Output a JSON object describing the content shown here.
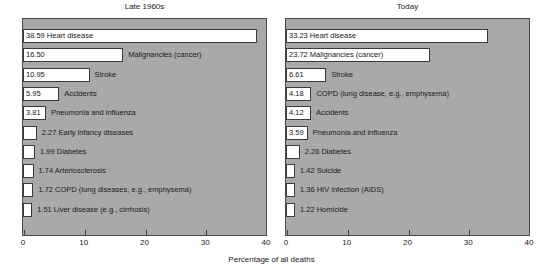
{
  "chart_data": {
    "type": "bar",
    "orientation": "horizontal",
    "title": "",
    "xlabel": "Percentage of all deaths",
    "ylabel": "Major causes of death",
    "xlim": [
      0,
      40
    ],
    "xticks": [
      0,
      10,
      20,
      30,
      40
    ],
    "grid": false,
    "legend": null,
    "panels": [
      {
        "title": "Late 1960s",
        "categories": [
          "Heart disease",
          "Malignancies (cancer)",
          "Stroke",
          "Accidents",
          "Pneumonia and influenza",
          "Early infancy diseases",
          "Diabetes",
          "Arteriosclerosis",
          "COPD (lung diseases, e.g., emphysema)",
          "Liver disease (e.g., cirrhosis)"
        ],
        "values": [
          38.59,
          16.5,
          10.95,
          5.95,
          3.81,
          2.27,
          1.99,
          1.74,
          1.72,
          1.51
        ],
        "bars": [
          {
            "value": "38.59",
            "label": "Heart disease",
            "label_inside": true
          },
          {
            "value": "16.50",
            "label": "Malignancies (cancer)",
            "label_inside": false
          },
          {
            "value": "10.95",
            "label": "Stroke",
            "label_inside": false
          },
          {
            "value": "5.95",
            "label": "Accidents",
            "label_inside": false
          },
          {
            "value": "3.81",
            "label": "Pneumonia and influenza",
            "label_inside": false
          },
          {
            "value": "2.27",
            "label": "Early infancy diseases",
            "label_inside": false
          },
          {
            "value": "1.99",
            "label": "Diabetes",
            "label_inside": false
          },
          {
            "value": "1.74",
            "label": "Arteriosclerosis",
            "label_inside": false
          },
          {
            "value": "1.72",
            "label": "COPD (lung diseases, e.g., emphysema)",
            "label_inside": false
          },
          {
            "value": "1.51",
            "label": "Liver disease (e.g., cirrhosis)",
            "label_inside": false
          }
        ]
      },
      {
        "title": "Today",
        "categories": [
          "Heart disease",
          "Malignancies (cancer)",
          "Stroke",
          "COPD (lung disease, e.g., emphysema)",
          "Accidents",
          "Pneumonia and influenza",
          "Diabetes",
          "Suicide",
          "HIV infection (AIDS)",
          "Homicide"
        ],
        "values": [
          33.23,
          23.72,
          6.61,
          4.18,
          4.12,
          3.59,
          2.26,
          1.42,
          1.36,
          1.22
        ],
        "bars": [
          {
            "value": "33.23",
            "label": "Heart disease",
            "label_inside": true
          },
          {
            "value": "23.72",
            "label": "Malignancies (cancer)",
            "label_inside": true
          },
          {
            "value": "6.61",
            "label": "Stroke",
            "label_inside": false
          },
          {
            "value": "4.18",
            "label": "COPD (lung disease, e.g., emphysema)",
            "label_inside": false
          },
          {
            "value": "4.12",
            "label": "Accidents",
            "label_inside": false
          },
          {
            "value": "3.59",
            "label": "Pneumonia and influenza",
            "label_inside": false
          },
          {
            "value": "2.26",
            "label": "Diabetes",
            "label_inside": false
          },
          {
            "value": "1.42",
            "label": "Suicide",
            "label_inside": false
          },
          {
            "value": "1.36",
            "label": "HIV infection (AIDS)",
            "label_inside": false
          },
          {
            "value": "1.22",
            "label": "Homicide",
            "label_inside": false
          }
        ]
      }
    ]
  },
  "colors": {
    "plot_background": "#a9a9a9",
    "bar_fill": "#ffffff",
    "bar_stroke": "#3a3a3a",
    "text": "#1a1a1a",
    "page_background": "#ffffff"
  }
}
